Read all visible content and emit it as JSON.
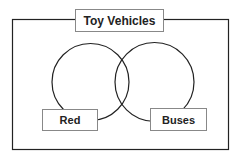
{
  "diagram": {
    "type": "venn",
    "title": "Toy Vehicles",
    "sets": [
      {
        "label": "Red"
      },
      {
        "label": "Buses"
      }
    ],
    "colors": {
      "line": "#222222",
      "box_border": "#888888",
      "background": "#ffffff"
    }
  }
}
